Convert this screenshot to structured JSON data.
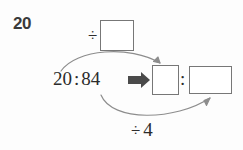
{
  "exercise": {
    "number": "20"
  },
  "problem": {
    "original_ratio": {
      "first_term": "20",
      "colon": ":",
      "second_term": "84"
    },
    "transform_arrow": "block-right-arrow",
    "result_ratio": {
      "first_term": "",
      "colon": ":",
      "second_term": ""
    }
  },
  "operations": {
    "top": {
      "divide_symbol": "÷",
      "value": ""
    },
    "bottom": {
      "divide_symbol": "÷",
      "value": "4"
    }
  },
  "colors": {
    "ink": "#2b2b2b",
    "box_border": "#777777",
    "arrow_curve": "#8d8d8d",
    "block_arrow": "#4a4a4a",
    "exercise_number": "#3a3a3a",
    "background": "#fdfdfd"
  }
}
